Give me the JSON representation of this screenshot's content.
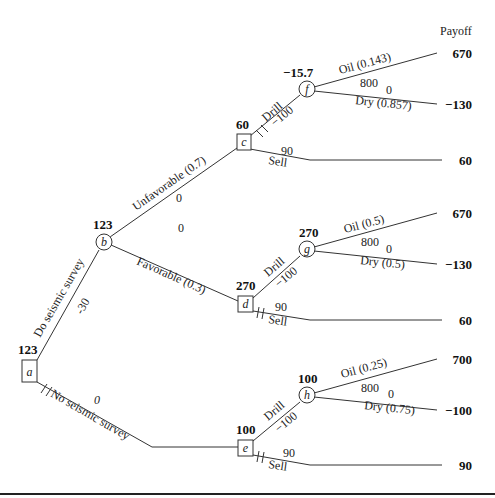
{
  "header": {
    "payoff_label": "Payoff"
  },
  "nodes": {
    "a": {
      "label": "a",
      "type": "decision",
      "value": "123"
    },
    "b": {
      "label": "b",
      "type": "chance",
      "value": "123"
    },
    "c": {
      "label": "c",
      "type": "decision",
      "value": "60"
    },
    "d": {
      "label": "d",
      "type": "decision",
      "value": "270"
    },
    "e": {
      "label": "e",
      "type": "decision",
      "value": "100"
    },
    "f": {
      "label": "f",
      "type": "chance",
      "value": "−15.7"
    },
    "g": {
      "label": "g",
      "type": "chance",
      "value": "270"
    },
    "h": {
      "label": "h",
      "type": "chance",
      "value": "100"
    }
  },
  "branches": {
    "do_survey": {
      "label": "Do seismic survey",
      "cost": "-30"
    },
    "no_survey": {
      "label": "No seismic survey",
      "cost": "0"
    },
    "unfavorable": {
      "label": "Unfavorable (0.7)",
      "cost": "0"
    },
    "favorable": {
      "label": "Favorable (0.3)",
      "cost": "0"
    },
    "c_drill": {
      "label": "Drill",
      "cost": "−100"
    },
    "c_sell": {
      "label": "Sell",
      "cost": "90"
    },
    "d_drill": {
      "label": "Drill",
      "cost": "−100"
    },
    "d_sell": {
      "label": "Sell",
      "cost": "90"
    },
    "e_drill": {
      "label": "Drill",
      "cost": "−100"
    },
    "e_sell": {
      "label": "Sell",
      "cost": "90"
    },
    "f_oil": {
      "label": "Oil (0.143)",
      "cost": "800"
    },
    "f_dry": {
      "label": "Dry (0.857)",
      "cost": "0"
    },
    "g_oil": {
      "label": "Oil (0.5)",
      "cost": "800"
    },
    "g_dry": {
      "label": "Dry (0.5)",
      "cost": "0"
    },
    "h_oil": {
      "label": "Oil (0.25)",
      "cost": "800"
    },
    "h_dry": {
      "label": "Dry (0.75)",
      "cost": "0"
    }
  },
  "payoffs": [
    "670",
    "−130",
    "60",
    "670",
    "−130",
    "60",
    "700",
    "−100",
    "90"
  ]
}
